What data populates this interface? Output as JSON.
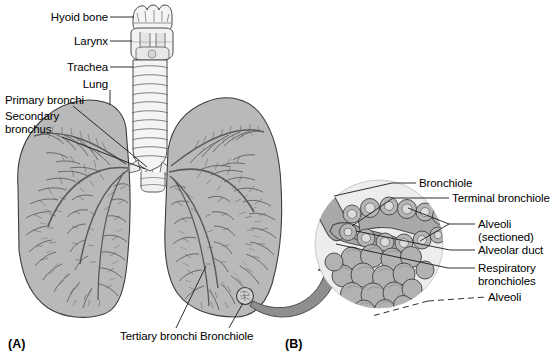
{
  "figure": {
    "background_color": "#ffffff",
    "width": 558,
    "height": 364
  },
  "palette": {
    "line": "#404040",
    "lung_fill": "#b8b8b8",
    "trachea_fill": "#f2f2f0",
    "circle_fill": "#ededed",
    "alveoli_fill": "#b0b0b0",
    "alveoli_shade": "#9a9a9a",
    "arrow_fill": "#8c8c8c",
    "text": "#000000"
  },
  "panels": [
    {
      "id": "panel-a",
      "label": "(A)",
      "x": 8,
      "y": 337
    },
    {
      "id": "panel-b",
      "label": "(B)",
      "x": 285,
      "y": 337
    }
  ],
  "panel_a": {
    "name": "whole-lung-overview",
    "labels": [
      {
        "id": "hyoid-bone",
        "text": "Hyoid bone",
        "x": 41,
        "y": 11,
        "align": "right",
        "leader": {
          "type": "line",
          "x1": 110,
          "y1": 17,
          "x2": 134,
          "y2": 17
        }
      },
      {
        "id": "larynx",
        "text": "Larynx",
        "x": 63,
        "y": 35,
        "align": "right",
        "leader": {
          "type": "line",
          "x1": 110,
          "y1": 41,
          "x2": 132,
          "y2": 41
        }
      },
      {
        "id": "trachea",
        "text": "Trachea",
        "x": 57,
        "y": 61,
        "align": "right",
        "leader": {
          "type": "line",
          "x1": 110,
          "y1": 67,
          "x2": 133,
          "y2": 67
        }
      },
      {
        "id": "lung",
        "text": "Lung",
        "x": 77,
        "y": 78,
        "align": "right",
        "leader": {
          "type": "line",
          "x1": 110,
          "y1": 90,
          "x2": 110,
          "y2": 104
        }
      },
      {
        "id": "primary-bronchi",
        "text": "Primary bronchi",
        "x": 6,
        "y": 94,
        "align": "left",
        "leader": {
          "type": "line",
          "x1": 73,
          "y1": 106,
          "x2": 146,
          "y2": 166
        }
      },
      {
        "id": "secondary-bronchus",
        "text": "Secondary\nbronchus",
        "x": 6,
        "y": 110,
        "align": "left",
        "leader": {
          "type": "line",
          "x1": 64,
          "y1": 136,
          "x2": 144,
          "y2": 168
        }
      },
      {
        "id": "tertiary-bronchi",
        "text": "Tertiary bronchi",
        "x": 120,
        "y": 334,
        "align": "left",
        "leader": {
          "type": "line",
          "x1": 175,
          "y1": 332,
          "x2": 205,
          "y2": 268
        }
      },
      {
        "id": "bronchiole",
        "text": "Bronchiole",
        "x": 199,
        "y": 334,
        "align": "left",
        "leader": {
          "type": "line",
          "x1": 228,
          "y1": 332,
          "x2": 244,
          "y2": 300
        }
      }
    ]
  },
  "panel_b": {
    "name": "alveoli-detail",
    "labels": [
      {
        "id": "bronchiole-detail",
        "text": "Bronchiole",
        "x": 418,
        "y": 177,
        "align": "left",
        "leader": {
          "type": "line",
          "x1": 392,
          "y1": 183,
          "x2": 415,
          "y2": 183
        }
      },
      {
        "id": "terminal-bronchiole",
        "text": "Terminal bronchiole",
        "x": 451,
        "y": 192,
        "align": "left",
        "leader": {
          "type": "line",
          "x1": 393,
          "y1": 198,
          "x2": 448,
          "y2": 198
        }
      },
      {
        "id": "alveoli-sectioned",
        "text": "Alveoli\n(sectioned)",
        "x": 477,
        "y": 218,
        "align": "left",
        "leader": {
          "type": "line",
          "x1": 448,
          "y1": 224,
          "x2": 474,
          "y2": 224
        }
      },
      {
        "id": "alveolar-duct",
        "text": "Alveolar duct",
        "x": 477,
        "y": 244,
        "align": "left",
        "leader": {
          "type": "line",
          "x1": 449,
          "y1": 250,
          "x2": 474,
          "y2": 250
        }
      },
      {
        "id": "respiratory-bronchioles",
        "text": "Respiratory\nbronchioles",
        "x": 477,
        "y": 262,
        "align": "left",
        "leader": {
          "type": "line",
          "x1": 447,
          "y1": 268,
          "x2": 474,
          "y2": 268
        }
      },
      {
        "id": "alveoli",
        "text": "Alveoli",
        "x": 487,
        "y": 293,
        "align": "left",
        "leader": {
          "type": "dashed",
          "x1": 430,
          "y1": 300,
          "x2": 484,
          "y2": 299
        }
      }
    ]
  },
  "structures": {
    "hyoid_bone": "hyoid-bone-shape",
    "larynx": "larynx-shape",
    "trachea": "trachea-rings",
    "left_lung": "left-lung-silhouette",
    "right_lung": "right-lung-silhouette",
    "bronchial_tree": "branching-airway-tree",
    "magnifier_circle": "alveoli-detail-circle",
    "zoom_arrow": "curved-zoom-arrow",
    "alveolar_sacs": "grape-cluster-alveoli"
  }
}
